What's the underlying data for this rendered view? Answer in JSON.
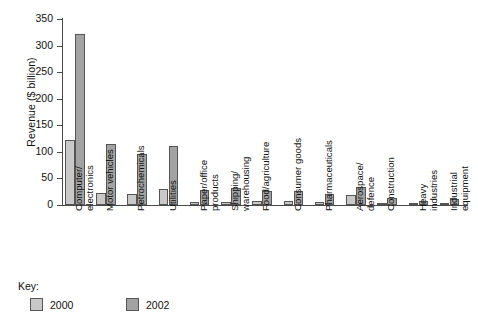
{
  "chart_data": {
    "type": "bar",
    "title": "",
    "xlabel": "",
    "ylabel": "Revenue ($ billion)",
    "ylim": [
      0,
      350
    ],
    "yticks": [
      0,
      50,
      100,
      150,
      200,
      250,
      300,
      350
    ],
    "grid": false,
    "legend_position": "bottom-left",
    "legend_title": "Key:",
    "categories": [
      "Computer/\nelectronics",
      "Motor vehicles",
      "Petrochemicals",
      "Utilities",
      "Paper/office\nproducts",
      "Shipping/\nwarehousing",
      "Food/agriculture",
      "Consumer goods",
      "Pharmaceuticals",
      "Aerospace/\ndefence",
      "Construction",
      "Heavy\nindustries",
      "Industrial\nequipment"
    ],
    "series": [
      {
        "name": "2000",
        "color": "#c9c9c9",
        "values": [
          122,
          23,
          21,
          31,
          6,
          6,
          8,
          7,
          5,
          18,
          3,
          2,
          2
        ]
      },
      {
        "name": "2002",
        "color": "#a3a3a3",
        "values": [
          322,
          114,
          96,
          111,
          28,
          32,
          27,
          26,
          20,
          33,
          14,
          7,
          11
        ]
      }
    ]
  },
  "axis": {
    "ylabel": "Revenue ($ billion)",
    "tick_labels": [
      "350",
      "300",
      "250",
      "200",
      "150",
      "100",
      "50",
      "0"
    ]
  },
  "legend": {
    "title": "Key:",
    "entries": [
      {
        "label": "2000",
        "swatch": "light-gray-swatch"
      },
      {
        "label": "2002",
        "swatch": "dark-gray-swatch"
      }
    ]
  },
  "caption": {
    "text": ""
  },
  "categories": [
    {
      "line1": "Computer/",
      "line2": "electronics"
    },
    {
      "line1": "Motor vehicles",
      "line2": ""
    },
    {
      "line1": "Petrochemicals",
      "line2": ""
    },
    {
      "line1": "Utilities",
      "line2": ""
    },
    {
      "line1": "Paper/office",
      "line2": "products"
    },
    {
      "line1": "Shipping/",
      "line2": "warehousing"
    },
    {
      "line1": "Food/agriculture",
      "line2": ""
    },
    {
      "line1": "Consumer goods",
      "line2": ""
    },
    {
      "line1": "Pharmaceuticals",
      "line2": ""
    },
    {
      "line1": "Aerospace/",
      "line2": "defence"
    },
    {
      "line1": "Construction",
      "line2": ""
    },
    {
      "line1": "Heavy",
      "line2": "industries"
    },
    {
      "line1": "Industrial",
      "line2": "equipment"
    }
  ]
}
